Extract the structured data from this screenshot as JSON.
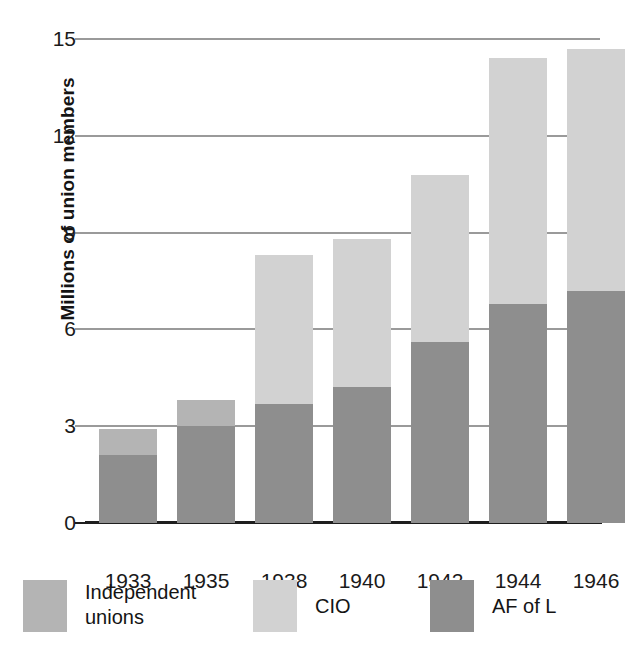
{
  "chart_data": {
    "type": "bar",
    "stacked": true,
    "title": "",
    "xlabel": "",
    "ylabel": "Millions of union members",
    "categories": [
      "1933",
      "1935",
      "1938",
      "1940",
      "1942",
      "1944",
      "1946"
    ],
    "ylim": [
      0,
      15
    ],
    "yticks": [
      0,
      3,
      6,
      9,
      12,
      15
    ],
    "ytick_labels": [
      "0",
      "3",
      "6",
      "9",
      "12",
      "15"
    ],
    "grid": true,
    "legend_position": "bottom",
    "series": [
      {
        "name": "AF of L",
        "color": "#8e8e8e",
        "values": [
          2.1,
          3.0,
          3.7,
          4.2,
          5.6,
          6.8,
          7.2
        ]
      },
      {
        "name": "CIO",
        "color": "#d2d2d2",
        "values": [
          0.0,
          0.0,
          4.6,
          4.6,
          5.2,
          7.6,
          7.5
        ]
      },
      {
        "name": "Independent unions",
        "color": "#b4b4b4",
        "values": [
          0.8,
          0.8,
          0.0,
          0.0,
          0.0,
          0.0,
          0.0
        ]
      }
    ],
    "totals": [
      2.9,
      3.8,
      8.3,
      8.8,
      10.8,
      14.4,
      14.7
    ]
  },
  "legend": [
    {
      "label": "Independent unions",
      "color": "#b4b4b4",
      "swatch_name": "legend-swatch-independent-unions"
    },
    {
      "label": "CIO",
      "color": "#d2d2d2",
      "swatch_name": "legend-swatch-cio"
    },
    {
      "label": "AF of L",
      "color": "#8e8e8e",
      "swatch_name": "legend-swatch-af-of-l"
    }
  ],
  "colors": {
    "af_of_l": "#8e8e8e",
    "cio": "#d2d2d2",
    "independent": "#b4b4b4",
    "gridline": "#9a9a9a",
    "axis": "#1e1e1e",
    "text": "#1a1a1a",
    "background": "#ffffff"
  }
}
